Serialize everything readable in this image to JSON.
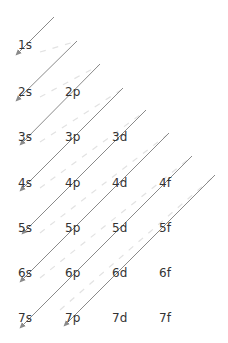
{
  "diagram": {
    "colors": {
      "label": "#333333",
      "arrow": "#8a8a8a",
      "dash": "#e2e2e2",
      "background": "#ffffff"
    },
    "orbitals": [
      {
        "label": "1s",
        "x": 18,
        "y": 49
      },
      {
        "label": "2s",
        "x": 18,
        "y": 96
      },
      {
        "label": "2p",
        "x": 65,
        "y": 96
      },
      {
        "label": "3s",
        "x": 18,
        "y": 141
      },
      {
        "label": "3p",
        "x": 65,
        "y": 141
      },
      {
        "label": "3d",
        "x": 112,
        "y": 141
      },
      {
        "label": "4s",
        "x": 18,
        "y": 187
      },
      {
        "label": "4p",
        "x": 65,
        "y": 187
      },
      {
        "label": "4d",
        "x": 112,
        "y": 187
      },
      {
        "label": "4f",
        "x": 159,
        "y": 187
      },
      {
        "label": "5s",
        "x": 18,
        "y": 232
      },
      {
        "label": "5p",
        "x": 65,
        "y": 232
      },
      {
        "label": "5d",
        "x": 112,
        "y": 232
      },
      {
        "label": "5f",
        "x": 159,
        "y": 232
      },
      {
        "label": "6s",
        "x": 18,
        "y": 277
      },
      {
        "label": "6p",
        "x": 65,
        "y": 277
      },
      {
        "label": "6d",
        "x": 112,
        "y": 277
      },
      {
        "label": "6f",
        "x": 159,
        "y": 277
      },
      {
        "label": "7s",
        "x": 18,
        "y": 322
      },
      {
        "label": "7p",
        "x": 65,
        "y": 322
      },
      {
        "label": "7d",
        "x": 112,
        "y": 322
      },
      {
        "label": "7f",
        "x": 159,
        "y": 322
      }
    ],
    "arrows": [
      {
        "id": "arrow-1s",
        "x1": 54,
        "y1": 17,
        "x2": 16,
        "y2": 55
      },
      {
        "id": "arrow-2s",
        "x1": 77,
        "y1": 41,
        "x2": 16,
        "y2": 101
      },
      {
        "id": "arrow-2p-3s",
        "x1": 100,
        "y1": 64,
        "x2": 20,
        "y2": 145
      },
      {
        "id": "arrow-3p-4s",
        "x1": 123,
        "y1": 88,
        "x2": 20,
        "y2": 191
      },
      {
        "id": "arrow-3d-5s",
        "x1": 146,
        "y1": 110,
        "x2": 22,
        "y2": 234
      },
      {
        "id": "arrow-4d-6s",
        "x1": 169,
        "y1": 133,
        "x2": 20,
        "y2": 282
      },
      {
        "id": "arrow-4f-7s",
        "x1": 192,
        "y1": 156,
        "x2": 20,
        "y2": 328
      },
      {
        "id": "arrow-5f-7p",
        "x1": 215,
        "y1": 175,
        "x2": 64,
        "y2": 326
      }
    ],
    "dashes": [
      {
        "x1": 40,
        "y1": 52,
        "x2": 74,
        "y2": 42
      },
      {
        "x1": 40,
        "y1": 97,
        "x2": 98,
        "y2": 66
      },
      {
        "x1": 40,
        "y1": 142,
        "x2": 121,
        "y2": 90
      },
      {
        "x1": 40,
        "y1": 188,
        "x2": 144,
        "y2": 112
      },
      {
        "x1": 40,
        "y1": 233,
        "x2": 167,
        "y2": 135
      },
      {
        "x1": 40,
        "y1": 278,
        "x2": 190,
        "y2": 158
      },
      {
        "x1": 60,
        "y1": 310,
        "x2": 212,
        "y2": 178
      }
    ]
  }
}
